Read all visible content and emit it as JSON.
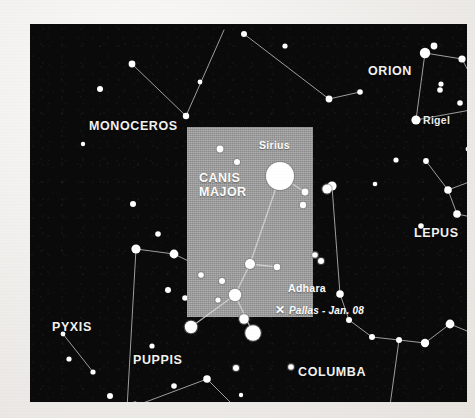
{
  "chart_data": {
    "type": "scatter",
    "xlabel": "",
    "ylabel": "",
    "background_color": "#0a0a0a",
    "star_color": "#ffffff",
    "highlight_color": "#9d9d9d",
    "constellations": [
      {
        "name": "MONOCEROS",
        "x": 104,
        "y": 104
      },
      {
        "name": "ORION",
        "x": 368,
        "y": 52
      },
      {
        "name": "LEPUS",
        "x": 411,
        "y": 216
      },
      {
        "name": "PYXIS",
        "x": 47,
        "y": 310
      },
      {
        "name": "PUPPIS",
        "x": 131,
        "y": 341
      },
      {
        "name": "COLUMBA",
        "x": 300,
        "y": 355
      },
      {
        "name": "CANIS MAJOR",
        "x": 191,
        "y": 165
      }
    ],
    "named_stars": [
      {
        "name": "Rigel",
        "label_x": 421,
        "label_y": 99,
        "x": 456,
        "y": 82,
        "magnitude_size": 11
      },
      {
        "name": "Sirius",
        "label_x": 232,
        "label_y": 129,
        "x": 250,
        "y": 152,
        "magnitude_size": 14
      },
      {
        "name": "Adhara",
        "label_x": 258,
        "label_y": 263,
        "x": 244,
        "y": 268,
        "magnitude_size": 11
      }
    ],
    "annotations": [
      {
        "marker": "✕",
        "text": "Pallas - Jan. 08",
        "x": 254,
        "y": 293
      }
    ],
    "legend_position": "none",
    "grid": false
  },
  "sky": {
    "panel": {
      "left": 30,
      "top": 24,
      "width": 437,
      "height": 378
    },
    "stars": [
      {
        "x": 70,
        "y": 65,
        "r": 3.0
      },
      {
        "x": 102,
        "y": 40,
        "r": 3.4
      },
      {
        "x": 156,
        "y": 92,
        "r": 3.2
      },
      {
        "x": 214,
        "y": 10,
        "r": 3.0
      },
      {
        "x": 255,
        "y": 22,
        "r": 2.6
      },
      {
        "x": 299,
        "y": 75,
        "r": 3.4
      },
      {
        "x": 330,
        "y": 68,
        "r": 2.8
      },
      {
        "x": 249,
        "y": 117,
        "r": 2.6
      },
      {
        "x": 170,
        "y": 58,
        "r": 2.4
      },
      {
        "x": 395,
        "y": 29,
        "r": 5.2
      },
      {
        "x": 404,
        "y": 22,
        "r": 3.4
      },
      {
        "x": 432,
        "y": 35,
        "r": 3.6
      },
      {
        "x": 411,
        "y": 60,
        "r": 2.6
      },
      {
        "x": 410,
        "y": 66,
        "r": 2.8
      },
      {
        "x": 386,
        "y": 96,
        "r": 4.6
      },
      {
        "x": 457,
        "y": 83,
        "r": 6.2
      },
      {
        "x": 430,
        "y": 79,
        "r": 2.8
      },
      {
        "x": 438,
        "y": 125,
        "r": 2.4
      },
      {
        "x": 452,
        "y": 122,
        "r": 2.2
      },
      {
        "x": 462,
        "y": 118,
        "r": 2.0
      },
      {
        "x": 366,
        "y": 136,
        "r": 2.6
      },
      {
        "x": 396,
        "y": 137,
        "r": 2.9
      },
      {
        "x": 455,
        "y": 152,
        "r": 3.4
      },
      {
        "x": 418,
        "y": 166,
        "r": 3.8
      },
      {
        "x": 391,
        "y": 202,
        "r": 2.8
      },
      {
        "x": 427,
        "y": 190,
        "r": 3.8
      },
      {
        "x": 345,
        "y": 160,
        "r": 2.3
      },
      {
        "x": 103,
        "y": 180,
        "r": 3.0
      },
      {
        "x": 53,
        "y": 120,
        "r": 2.2
      },
      {
        "x": 128,
        "y": 210,
        "r": 2.8
      },
      {
        "x": 174,
        "y": 207,
        "r": 2.6
      },
      {
        "x": 106,
        "y": 225,
        "r": 4.6
      },
      {
        "x": 144,
        "y": 230,
        "r": 4.4
      },
      {
        "x": 160,
        "y": 252,
        "r": 2.6
      },
      {
        "x": 138,
        "y": 266,
        "r": 3.0
      },
      {
        "x": 155,
        "y": 274,
        "r": 2.8
      },
      {
        "x": 177,
        "y": 246,
        "r": 2.6
      },
      {
        "x": 33,
        "y": 310,
        "r": 2.4
      },
      {
        "x": 39,
        "y": 335,
        "r": 2.6
      },
      {
        "x": 63,
        "y": 348,
        "r": 2.6
      },
      {
        "x": 80,
        "y": 372,
        "r": 3.0
      },
      {
        "x": 97,
        "y": 385,
        "r": 4.6
      },
      {
        "x": 105,
        "y": 380,
        "r": 2.6
      },
      {
        "x": 126,
        "y": 389,
        "r": 2.6
      },
      {
        "x": 144,
        "y": 362,
        "r": 2.8
      },
      {
        "x": 177,
        "y": 355,
        "r": 3.8
      },
      {
        "x": 122,
        "y": 322,
        "r": 2.6
      },
      {
        "x": 302,
        "y": 162,
        "r": 4.6
      },
      {
        "x": 310,
        "y": 270,
        "r": 3.8
      },
      {
        "x": 319,
        "y": 296,
        "r": 3.0
      },
      {
        "x": 342,
        "y": 313,
        "r": 3.0
      },
      {
        "x": 369,
        "y": 316,
        "r": 3.0
      },
      {
        "x": 395,
        "y": 319,
        "r": 4.2
      },
      {
        "x": 420,
        "y": 300,
        "r": 4.4
      },
      {
        "x": 449,
        "y": 312,
        "r": 3.0
      },
      {
        "x": 263,
        "y": 393,
        "r": 2.4
      },
      {
        "x": 211,
        "y": 371,
        "r": 2.2
      }
    ],
    "lines": [
      [
        [
          102,
          40
        ],
        [
          156,
          92
        ]
      ],
      [
        [
          156,
          92
        ],
        [
          194,
          6
        ]
      ],
      [
        [
          214,
          10
        ],
        [
          299,
          75
        ]
      ],
      [
        [
          299,
          75
        ],
        [
          330,
          68
        ]
      ],
      [
        [
          395,
          29
        ],
        [
          386,
          96
        ]
      ],
      [
        [
          395,
          29
        ],
        [
          432,
          35
        ]
      ],
      [
        [
          432,
          35
        ],
        [
          457,
          83
        ]
      ],
      [
        [
          386,
          96
        ],
        [
          457,
          83
        ]
      ],
      [
        [
          457,
          83
        ],
        [
          455,
          152
        ]
      ],
      [
        [
          455,
          152
        ],
        [
          418,
          166
        ]
      ],
      [
        [
          418,
          166
        ],
        [
          427,
          190
        ]
      ],
      [
        [
          427,
          190
        ],
        [
          475,
          200
        ]
      ],
      [
        [
          418,
          166
        ],
        [
          396,
          137
        ]
      ],
      [
        [
          106,
          225
        ],
        [
          144,
          230
        ]
      ],
      [
        [
          144,
          230
        ],
        [
          177,
          246
        ]
      ],
      [
        [
          106,
          225
        ],
        [
          97,
          385
        ]
      ],
      [
        [
          97,
          385
        ],
        [
          177,
          355
        ]
      ],
      [
        [
          177,
          355
        ],
        [
          240,
          418
        ]
      ],
      [
        [
          33,
          310
        ],
        [
          63,
          348
        ]
      ],
      [
        [
          302,
          162
        ],
        [
          310,
          270
        ]
      ],
      [
        [
          310,
          270
        ],
        [
          319,
          296
        ]
      ],
      [
        [
          319,
          296
        ],
        [
          342,
          313
        ]
      ],
      [
        [
          342,
          313
        ],
        [
          369,
          316
        ]
      ],
      [
        [
          369,
          316
        ],
        [
          395,
          319
        ]
      ],
      [
        [
          395,
          319
        ],
        [
          420,
          300
        ]
      ],
      [
        [
          420,
          300
        ],
        [
          449,
          312
        ]
      ],
      [
        [
          369,
          316
        ],
        [
          355,
          418
        ]
      ]
    ]
  },
  "highlight": {
    "box": {
      "left": 157,
      "top": 103,
      "width": 126,
      "height": 190
    },
    "constellation_label": "CANIS\nMAJOR",
    "constellation_label_pos": {
      "x": 12,
      "y": 52
    },
    "stars": [
      {
        "x": 33,
        "y": 22,
        "r": 3.4,
        "name": ""
      },
      {
        "x": 50,
        "y": 35,
        "r": 3.0,
        "name": ""
      },
      {
        "x": 93,
        "y": 49,
        "r": 14.0,
        "name": "Sirius"
      },
      {
        "x": 118,
        "y": 65,
        "r": 3.4,
        "name": ""
      },
      {
        "x": 116,
        "y": 78,
        "r": 3.2,
        "name": ""
      },
      {
        "x": 140,
        "y": 62,
        "r": 4.6,
        "name": ""
      },
      {
        "x": 128,
        "y": 128,
        "r": 2.8,
        "name": ""
      },
      {
        "x": 134,
        "y": 134,
        "r": 3.0,
        "name": ""
      },
      {
        "x": 63,
        "y": 137,
        "r": 5.0,
        "name": ""
      },
      {
        "x": 90,
        "y": 140,
        "r": 3.2,
        "name": ""
      },
      {
        "x": 14,
        "y": 148,
        "r": 2.8,
        "name": ""
      },
      {
        "x": 35,
        "y": 154,
        "r": 3.0,
        "name": ""
      },
      {
        "x": 48,
        "y": 168,
        "r": 6.2,
        "name": ""
      },
      {
        "x": 31,
        "y": 173,
        "r": 2.6,
        "name": ""
      },
      {
        "x": 57,
        "y": 192,
        "r": 4.8,
        "name": ""
      },
      {
        "x": 66,
        "y": 206,
        "r": 7.8,
        "name": "Adhara"
      },
      {
        "x": 4,
        "y": 200,
        "r": 6.2,
        "name": ""
      },
      {
        "x": 49,
        "y": 241,
        "r": 3.0,
        "name": ""
      },
      {
        "x": 104,
        "y": 240,
        "r": 2.8,
        "name": ""
      }
    ],
    "lines": [
      [
        [
          93,
          49
        ],
        [
          63,
          137
        ]
      ],
      [
        [
          63,
          137
        ],
        [
          48,
          168
        ]
      ],
      [
        [
          48,
          168
        ],
        [
          66,
          206
        ]
      ],
      [
        [
          63,
          137
        ],
        [
          90,
          140
        ]
      ],
      [
        [
          48,
          168
        ],
        [
          4,
          200
        ]
      ],
      [
        [
          93,
          49
        ],
        [
          118,
          65
        ]
      ]
    ],
    "star_labels": [
      {
        "text": "Sirius",
        "x": 72,
        "y": 19
      },
      {
        "text": "Adhara",
        "x": 101,
        "y": 160
      }
    ],
    "marker": {
      "glyph": "✕",
      "x": 90,
      "y": 183
    },
    "marker_text": "Pallas - Jan. 08",
    "marker_text_pos": {
      "x": 103,
      "y": 184
    }
  },
  "sky_labels": {
    "monoceros": {
      "text": "MONOCEROS",
      "x": 59,
      "y": 96
    },
    "orion": {
      "text": "ORION",
      "x": 338,
      "y": 41
    },
    "rigel": {
      "text": "Rigel",
      "x": 393,
      "y": 90
    },
    "lepus": {
      "text": "LEPUS",
      "x": 384,
      "y": 203
    },
    "pyxis": {
      "text": "PYXIS",
      "x": 22,
      "y": 297
    },
    "puppis": {
      "text": "PUPPIS",
      "x": 103,
      "y": 330
    },
    "columba": {
      "text": "COLUMBA",
      "x": 268,
      "y": 342
    }
  }
}
